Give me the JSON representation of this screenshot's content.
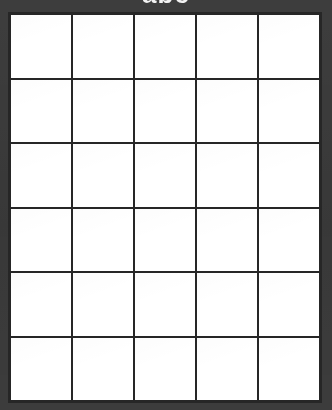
{
  "page": {
    "title_clipped": "abc",
    "background_color": "#3b3b3b",
    "cell_color": "#ffffff",
    "grid_line_color": "#262626"
  },
  "grid": {
    "columns": 5,
    "rows": 6,
    "cells": [
      {
        "id": "r1c1",
        "text": ""
      },
      {
        "id": "r1c2",
        "text": ""
      },
      {
        "id": "r1c3",
        "text": ""
      },
      {
        "id": "r1c4",
        "text": ""
      },
      {
        "id": "r1c5",
        "text": ""
      },
      {
        "id": "r2c1",
        "text": ""
      },
      {
        "id": "r2c2",
        "text": ""
      },
      {
        "id": "r2c3",
        "text": ""
      },
      {
        "id": "r2c4",
        "text": ""
      },
      {
        "id": "r2c5",
        "text": ""
      },
      {
        "id": "r3c1",
        "text": ""
      },
      {
        "id": "r3c2",
        "text": ""
      },
      {
        "id": "r3c3",
        "text": ""
      },
      {
        "id": "r3c4",
        "text": ""
      },
      {
        "id": "r3c5",
        "text": ""
      },
      {
        "id": "r4c1",
        "text": ""
      },
      {
        "id": "r4c2",
        "text": ""
      },
      {
        "id": "r4c3",
        "text": ""
      },
      {
        "id": "r4c4",
        "text": ""
      },
      {
        "id": "r4c5",
        "text": ""
      },
      {
        "id": "r5c1",
        "text": ""
      },
      {
        "id": "r5c2",
        "text": ""
      },
      {
        "id": "r5c3",
        "text": ""
      },
      {
        "id": "r5c4",
        "text": ""
      },
      {
        "id": "r5c5",
        "text": ""
      },
      {
        "id": "r6c1",
        "text": ""
      },
      {
        "id": "r6c2",
        "text": ""
      },
      {
        "id": "r6c3",
        "text": ""
      },
      {
        "id": "r6c4",
        "text": ""
      },
      {
        "id": "r6c5",
        "text": ""
      }
    ]
  }
}
